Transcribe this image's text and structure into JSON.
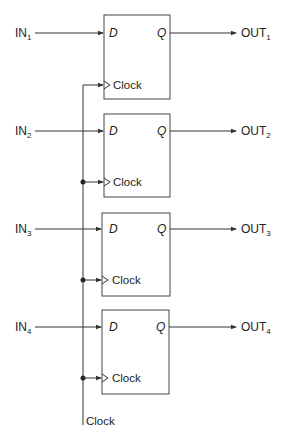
{
  "diagram": {
    "type": "register-of-d-flip-flops",
    "pin_d": "D",
    "pin_q": "Q",
    "pin_clock": "Clock",
    "clock_input_label": "Clock",
    "flip_flops": [
      {
        "in_label": "IN",
        "in_sub": "1",
        "out_label": "OUT",
        "out_sub": "1"
      },
      {
        "in_label": "IN",
        "in_sub": "2",
        "out_label": "OUT",
        "out_sub": "2"
      },
      {
        "in_label": "IN",
        "in_sub": "3",
        "out_label": "OUT",
        "out_sub": "3"
      },
      {
        "in_label": "IN",
        "in_sub": "4",
        "out_label": "OUT",
        "out_sub": "4"
      }
    ],
    "colors": {
      "line": "#333333",
      "text": "#222222",
      "background": "#ffffff"
    }
  }
}
